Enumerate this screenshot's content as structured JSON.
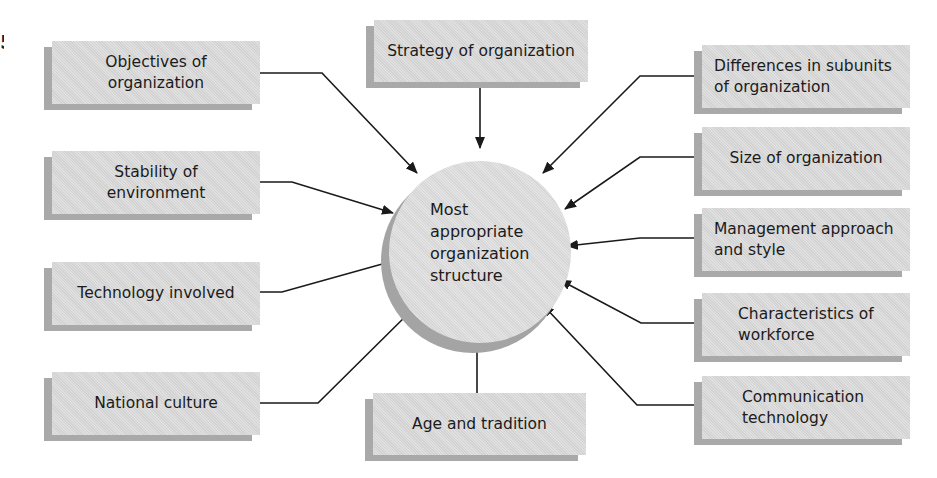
{
  "diagram": {
    "center": {
      "label": "Most\nappropriate\norganization\nstructure"
    },
    "factors": {
      "objectives": "Objectives of\norganization",
      "stability": "Stability of\nenvironment",
      "technology": "Technology involved",
      "national_culture": "National culture",
      "strategy": "Strategy of organization",
      "age_tradition": "Age and tradition",
      "differences_subunits": "Differences in subunits\nof organization",
      "size": "Size of organization",
      "management": "Management approach\nand style",
      "workforce": "Characteristics of\nworkforce",
      "communication": "Communication\ntechnology"
    },
    "colors": {
      "box_face": "#d9d9d9",
      "box_shadow": "#a9a9a9",
      "circle_face": "#dddddd",
      "circle_shadow": "#a4a4a4",
      "line": "#1a1a1a"
    }
  }
}
